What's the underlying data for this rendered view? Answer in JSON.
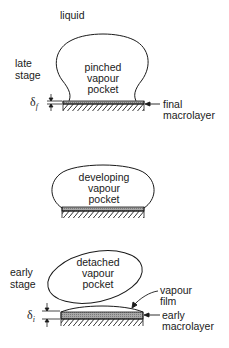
{
  "labels": {
    "liquid": "liquid",
    "late_stage": [
      "late",
      "stage"
    ],
    "early_stage": [
      "early",
      "stage"
    ]
  },
  "stages": [
    {
      "id": "late",
      "bubble_label": [
        "pinched",
        "vapour",
        "pocket"
      ],
      "thickness_symbol": "δ",
      "thickness_subscript": "f",
      "annotation": [
        "final",
        "macrolayer"
      ]
    },
    {
      "id": "middle",
      "bubble_label": [
        "developing",
        "vapour",
        "pocket"
      ]
    },
    {
      "id": "early",
      "bubble_label": [
        "detached",
        "vapour",
        "pocket"
      ],
      "thickness_symbol": "δ",
      "thickness_subscript": "i",
      "annotation_film": [
        "vapour",
        "film"
      ],
      "annotation": [
        "early",
        "macrolayer"
      ]
    }
  ],
  "colors": {
    "line": "#1a1a1a",
    "macrolayer_fill": "#9a9a9a",
    "background": "#ffffff"
  }
}
